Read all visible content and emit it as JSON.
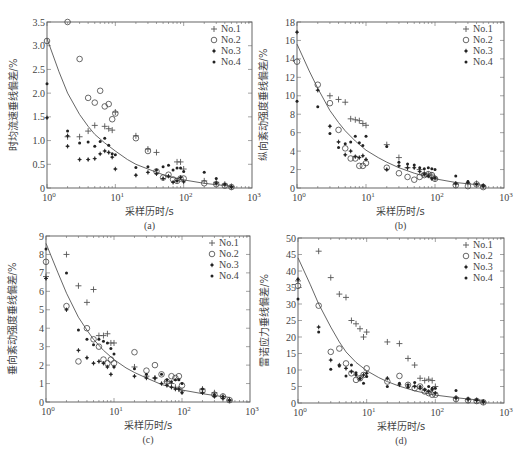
{
  "figure": {
    "common_xlabel": "采样历时/s",
    "legend": [
      "No.1",
      "No.2",
      "No.3",
      "No.4"
    ],
    "markers": {
      "No.1": "plus",
      "No.2": "circle",
      "No.3": "star",
      "No.4": "dot"
    }
  },
  "chart_data": [
    {
      "id": "a",
      "type": "scatter",
      "caption": "(a)",
      "title": "",
      "xlabel": "采样历时/s",
      "ylabel": "时均流速垂线偏差/%",
      "xscale": "log",
      "xlim": [
        1,
        1000
      ],
      "ylim": [
        0,
        3.5
      ],
      "yticks": [
        0,
        0.5,
        1.0,
        1.5,
        2.0,
        2.5,
        3.0,
        3.5
      ],
      "ytick_labels": [
        "0",
        "0.5",
        "1.0",
        "1.5",
        "2.0",
        "2.5",
        "3.0",
        "3.5"
      ],
      "xtick_labels": [
        "10^0",
        "10^1",
        "10^2",
        "10^3"
      ],
      "legend_position": "upper right",
      "grid": false,
      "fit_curve": {
        "x": [
          1,
          1.5,
          2,
          3,
          4,
          5,
          7,
          10,
          15,
          20,
          30,
          50,
          70,
          100,
          200,
          300,
          500
        ],
        "y": [
          3.15,
          2.45,
          2.0,
          1.55,
          1.3,
          1.13,
          0.95,
          0.78,
          0.6,
          0.5,
          0.4,
          0.28,
          0.22,
          0.17,
          0.1,
          0.07,
          0.04
        ]
      },
      "series": [
        {
          "name": "No.1",
          "x": [
            2,
            3,
            4,
            5,
            7,
            8,
            9,
            10,
            20,
            30,
            40,
            80,
            90,
            100,
            200,
            300,
            400,
            500
          ],
          "y": [
            1.08,
            1.08,
            1.2,
            1.32,
            1.3,
            1.25,
            1.22,
            1.6,
            1.1,
            0.82,
            0.75,
            0.55,
            0.55,
            0.4,
            0.15,
            0.12,
            0.08,
            0.03
          ]
        },
        {
          "name": "No.2",
          "x": [
            1,
            2,
            3,
            4,
            5,
            6,
            7,
            8,
            9,
            10,
            20,
            30,
            40,
            50,
            60,
            70,
            80,
            90,
            100,
            200,
            300,
            400,
            500
          ],
          "y": [
            3.1,
            3.5,
            2.72,
            1.9,
            1.8,
            2.05,
            1.72,
            1.77,
            1.45,
            1.57,
            1.05,
            0.78,
            0.35,
            0.22,
            0.28,
            0.18,
            0.15,
            0.2,
            0.2,
            0.1,
            0.08,
            0.05,
            0.02
          ]
        },
        {
          "name": "No.3",
          "x": [
            1,
            2,
            2,
            3,
            4,
            5,
            6,
            7,
            8,
            9,
            10,
            20,
            30,
            40,
            50,
            60,
            70,
            80,
            90,
            100,
            300,
            500
          ],
          "y": [
            1.48,
            0.88,
            1.1,
            0.6,
            0.6,
            0.62,
            0.72,
            0.78,
            0.75,
            0.65,
            0.4,
            0.27,
            0.33,
            0.3,
            0.2,
            0.25,
            0.12,
            0.15,
            0.22,
            0.13,
            0.1,
            0.02
          ]
        },
        {
          "name": "No.4",
          "x": [
            1,
            2,
            3,
            4,
            5,
            6,
            7,
            8,
            9,
            10,
            20,
            30,
            40,
            50,
            60,
            70,
            80,
            90,
            100,
            200,
            300,
            400,
            500
          ],
          "y": [
            2.2,
            1.2,
            0.95,
            0.97,
            0.88,
            0.98,
            1.05,
            0.9,
            0.72,
            0.7,
            0.43,
            0.45,
            0.38,
            0.45,
            0.48,
            0.38,
            0.42,
            0.42,
            0.35,
            0.33,
            0.2,
            0.08,
            0.03
          ]
        }
      ]
    },
    {
      "id": "b",
      "type": "scatter",
      "caption": "(b)",
      "title": "",
      "xlabel": "采样历时/s",
      "ylabel": "纵向紊动强度垂线偏差/%",
      "xscale": "log",
      "xlim": [
        1,
        1000
      ],
      "ylim": [
        0,
        18
      ],
      "yticks": [
        0,
        2,
        4,
        6,
        8,
        10,
        12,
        14,
        16,
        18
      ],
      "ytick_labels": [
        "0",
        "2",
        "4",
        "6",
        "8",
        "10",
        "12",
        "14",
        "16",
        "18"
      ],
      "xtick_labels": [
        "10^0",
        "10^1",
        "10^2",
        "10^3"
      ],
      "legend_position": "upper right",
      "grid": false,
      "fit_curve": {
        "x": [
          1,
          1.5,
          2,
          3,
          4,
          5,
          7,
          10,
          15,
          20,
          30,
          50,
          70,
          100,
          200,
          300,
          500
        ],
        "y": [
          15.6,
          12.7,
          10.8,
          8.4,
          7.1,
          6.2,
          5.1,
          4.1,
          3.3,
          2.8,
          2.2,
          1.6,
          1.3,
          1.0,
          0.6,
          0.45,
          0.3
        ]
      },
      "series": [
        {
          "name": "No.1",
          "x": [
            3,
            4,
            5,
            6,
            7,
            8,
            9,
            10,
            20,
            30,
            40,
            60,
            70,
            80,
            90,
            100,
            200,
            300,
            400,
            500
          ],
          "y": [
            10,
            9.6,
            9.3,
            7.5,
            7.4,
            7.3,
            7.0,
            6.8,
            4.7,
            3.3,
            2.2,
            2.0,
            1.6,
            1.5,
            1.4,
            1.0,
            0.4,
            0.5,
            0.5,
            0.2
          ]
        },
        {
          "name": "No.2",
          "x": [
            1,
            2,
            3,
            4,
            5,
            6,
            7,
            8,
            9,
            10,
            20,
            30,
            40,
            50,
            60,
            70,
            80,
            90,
            100,
            200,
            300,
            400,
            500
          ],
          "y": [
            13.7,
            11.2,
            9.2,
            6.3,
            4.3,
            3.2,
            3.2,
            2.4,
            2.4,
            2.7,
            2.2,
            1.6,
            1.2,
            0.9,
            1.2,
            1.4,
            1.5,
            1.4,
            1.0,
            0.3,
            0.2,
            0.4,
            0.1
          ]
        },
        {
          "name": "No.3",
          "x": [
            1,
            2,
            3,
            4,
            5,
            6,
            7,
            8,
            9,
            10,
            20,
            30,
            40,
            50,
            60,
            70,
            80,
            90,
            100,
            200,
            300,
            500
          ],
          "y": [
            16.9,
            10.6,
            6.7,
            5.0,
            3.6,
            4.0,
            3.4,
            3.3,
            3.5,
            3.1,
            2.0,
            2.4,
            2.2,
            2.2,
            1.8,
            1.5,
            1.3,
            1.0,
            1.1,
            0.5,
            0.6,
            0.2
          ]
        },
        {
          "name": "No.4",
          "x": [
            1,
            2,
            3,
            4,
            5,
            6,
            7,
            8,
            9,
            10,
            20,
            30,
            40,
            50,
            60,
            70,
            80,
            90,
            100,
            200,
            300,
            400,
            500
          ],
          "y": [
            9.4,
            8.8,
            5.9,
            4.4,
            4.8,
            5.0,
            5.6,
            4.9,
            4.6,
            5.6,
            4.5,
            2.8,
            2.6,
            2.5,
            2.2,
            2.1,
            2.2,
            2.1,
            2.0,
            1.3,
            0.7,
            0.4,
            0.3
          ]
        }
      ]
    },
    {
      "id": "c",
      "type": "scatter",
      "caption": "(c)",
      "title": "",
      "xlabel": "采样历时/s",
      "ylabel": "垂向紊动强度垂线偏差/%",
      "xscale": "log",
      "xlim": [
        1,
        1000
      ],
      "ylim": [
        0,
        9
      ],
      "yticks": [
        0,
        1,
        2,
        3,
        4,
        5,
        6,
        7,
        8,
        9
      ],
      "ytick_labels": [
        "0",
        "1",
        "2",
        "3",
        "4",
        "5",
        "6",
        "7",
        "8",
        "9"
      ],
      "xtick_labels": [
        "10^0",
        "10^1",
        "10^2",
        "10^3"
      ],
      "legend_position": "upper right",
      "grid": false,
      "fit_curve": {
        "x": [
          1,
          1.5,
          2,
          3,
          4,
          5,
          7,
          10,
          15,
          20,
          30,
          50,
          70,
          100,
          200,
          300,
          500
        ],
        "y": [
          8.6,
          7.0,
          5.9,
          4.6,
          3.9,
          3.4,
          2.8,
          2.3,
          1.85,
          1.6,
          1.3,
          0.95,
          0.8,
          0.65,
          0.45,
          0.35,
          0.25
        ]
      },
      "series": [
        {
          "name": "No.1",
          "x": [
            1,
            2,
            3,
            4,
            5,
            6,
            7,
            8,
            9,
            10,
            20,
            30,
            40,
            60,
            70,
            80,
            90,
            100,
            200,
            300,
            400,
            500
          ],
          "y": [
            6.8,
            8.0,
            6.3,
            5.4,
            6.1,
            3.6,
            3.6,
            3.7,
            3.2,
            3.2,
            1.9,
            1.4,
            1.3,
            1.1,
            1.0,
            0.8,
            0.7,
            0.6,
            0.7,
            0.5,
            0.3,
            0.1
          ]
        },
        {
          "name": "No.2",
          "x": [
            1,
            2,
            3,
            4,
            5,
            6,
            7,
            8,
            9,
            10,
            20,
            30,
            40,
            50,
            60,
            70,
            80,
            90,
            100,
            200,
            300,
            400,
            500
          ],
          "y": [
            7.6,
            5.2,
            2.2,
            4.0,
            3.4,
            3.0,
            2.3,
            2.1,
            2.3,
            2.1,
            2.7,
            1.7,
            2.0,
            1.5,
            1.1,
            1.4,
            1.3,
            1.4,
            0.9,
            0.6,
            0.4,
            0.3,
            0.1
          ]
        },
        {
          "name": "No.3",
          "x": [
            1,
            2,
            3,
            4,
            5,
            6,
            7,
            8,
            9,
            10,
            20,
            30,
            40,
            50,
            60,
            70,
            80,
            90,
            100,
            200,
            300,
            400,
            500
          ],
          "y": [
            6.7,
            5.0,
            2.8,
            2.4,
            2.1,
            2.2,
            2.1,
            1.9,
            1.5,
            1.9,
            1.4,
            1.3,
            1.3,
            1.0,
            0.9,
            0.8,
            0.7,
            0.7,
            0.5,
            0.5,
            0.3,
            0.2,
            0.1
          ]
        },
        {
          "name": "No.4",
          "x": [
            1,
            2,
            3,
            4,
            5,
            6,
            7,
            8,
            9,
            10,
            20,
            30,
            40,
            50,
            60,
            70,
            80,
            90,
            100,
            200,
            300,
            400,
            500
          ],
          "y": [
            8.3,
            7.0,
            3.9,
            3.4,
            3.1,
            3.4,
            3.3,
            3.2,
            2.9,
            2.6,
            1.8,
            1.5,
            1.3,
            1.5,
            1.2,
            1.1,
            1.2,
            1.2,
            1.0,
            0.7,
            0.4,
            0.3,
            0.1
          ]
        }
      ]
    },
    {
      "id": "d",
      "type": "scatter",
      "caption": "(d)",
      "title": "",
      "xlabel": "采样历时/s",
      "ylabel": "雷诺应力垂线偏差/%",
      "xscale": "log",
      "xlim": [
        1,
        1000
      ],
      "ylim": [
        0,
        50
      ],
      "yticks": [
        0,
        5,
        10,
        15,
        20,
        25,
        30,
        35,
        40,
        45,
        50
      ],
      "ytick_labels": [
        "0",
        "5",
        "10",
        "15",
        "20",
        "25",
        "30",
        "35",
        "40",
        "45",
        "50"
      ],
      "xtick_labels": [
        "10^0",
        "10^1",
        "10^2",
        "10^3"
      ],
      "legend_position": "upper right",
      "grid": false,
      "fit_curve": {
        "x": [
          1,
          1.5,
          2,
          3,
          4,
          5,
          7,
          10,
          15,
          20,
          30,
          50,
          70,
          100,
          200,
          300,
          500
        ],
        "y": [
          44,
          36,
          30,
          23,
          18.5,
          15.5,
          12.3,
          9.8,
          7.7,
          6.5,
          5.1,
          3.7,
          3.0,
          2.4,
          1.6,
          1.2,
          0.8
        ]
      },
      "series": [
        {
          "name": "No.1",
          "x": [
            1,
            2,
            3,
            4,
            5,
            6,
            7,
            8,
            9,
            10,
            20,
            30,
            40,
            50,
            60,
            70,
            80,
            90,
            100,
            200,
            300,
            400,
            500
          ],
          "y": [
            37,
            46,
            38,
            33,
            32,
            25,
            24,
            22.5,
            20,
            21.5,
            18.5,
            18,
            13.5,
            11.5,
            7.5,
            6.8,
            7.2,
            6.8,
            5,
            1.5,
            1.0,
            0.8,
            0.3
          ]
        },
        {
          "name": "No.2",
          "x": [
            1,
            2,
            3,
            4,
            5,
            6,
            7,
            8,
            9,
            10,
            20,
            30,
            40,
            50,
            60,
            70,
            80,
            90,
            100,
            200,
            300,
            400,
            500
          ],
          "y": [
            35.5,
            29.5,
            15.5,
            16.5,
            12,
            9,
            7,
            7.5,
            8.5,
            10.5,
            6.5,
            8.2,
            5.5,
            4.5,
            5,
            3.5,
            3,
            2.5,
            2.5,
            1.2,
            0.8,
            0.6,
            0.2
          ]
        },
        {
          "name": "No.3",
          "x": [
            1,
            2,
            3,
            4,
            5,
            6,
            7,
            8,
            9,
            10,
            20,
            30,
            40,
            50,
            60,
            70,
            80,
            90,
            100,
            200,
            300,
            400,
            500
          ],
          "y": [
            37.5,
            23,
            13,
            11.5,
            10.5,
            9.5,
            8.5,
            7.5,
            8.5,
            9,
            7.5,
            5.5,
            5.5,
            5,
            4.5,
            4,
            3.5,
            4,
            3,
            1.5,
            1.2,
            0.8,
            0.3
          ]
        },
        {
          "name": "No.4",
          "x": [
            1,
            2,
            3,
            4,
            5,
            6,
            7,
            8,
            9,
            10,
            20,
            30,
            40,
            50,
            60,
            70,
            80,
            90,
            100,
            200,
            300,
            400,
            500
          ],
          "y": [
            31.5,
            21.5,
            10.2,
            11.2,
            8.2,
            11.5,
            9.2,
            7.3,
            6,
            8,
            5,
            6,
            4.8,
            6.2,
            5,
            4,
            5,
            4.5,
            4.5,
            3.8,
            1.2,
            1,
            0.5
          ]
        }
      ]
    }
  ]
}
